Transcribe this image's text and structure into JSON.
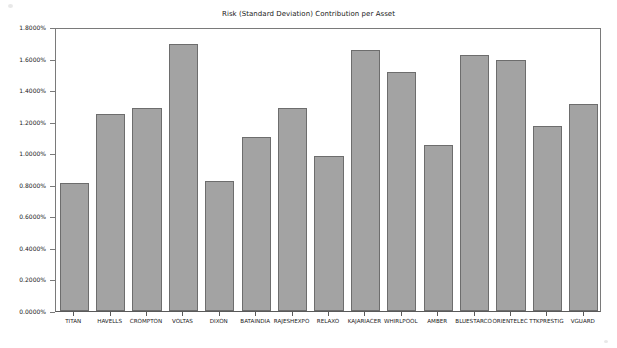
{
  "chart_data": {
    "type": "bar",
    "title": "Risk (Standard Deviation) Contribution per Asset",
    "xlabel": "",
    "ylabel": "",
    "grid": false,
    "legend": null,
    "ylim": [
      0.0,
      1.8
    ],
    "yunit": "%",
    "ytick_labels": [
      "0.0000%",
      "0.2000%",
      "0.4000%",
      "0.6000%",
      "0.8000%",
      "1.0000%",
      "1.2000%",
      "1.4000%",
      "1.6000%",
      "1.8000%"
    ],
    "ytick_values": [
      0.0,
      0.2,
      0.4,
      0.6,
      0.8,
      1.0,
      1.2,
      1.4,
      1.6,
      1.8
    ],
    "categories": [
      "TITAN",
      "HAVELLS",
      "CROMPTON",
      "VOLTAS",
      "DIXON",
      "BATAINDIA",
      "RAJESHEXPO",
      "RELAXO",
      "KAJARIACER",
      "WHIRLPOOL",
      "AMBER",
      "BLUESTARCO",
      "ORIENTELEC",
      "TTKPRESTIG",
      "VGUARD"
    ],
    "values": [
      0.81,
      1.25,
      1.285,
      1.695,
      0.825,
      1.1,
      1.285,
      0.985,
      1.655,
      1.515,
      1.055,
      1.625,
      1.59,
      1.17,
      1.315
    ],
    "bar_color": "#a3a3a3",
    "bar_edge_color": "#6d6d6d",
    "axes_color": "#7a7a7a",
    "text_color": "#1a1a1a",
    "background_color": "#ffffff"
  }
}
